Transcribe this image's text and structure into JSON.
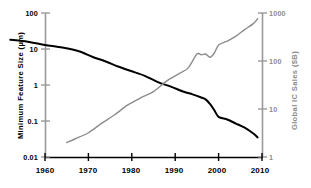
{
  "chart_data": {
    "type": "line",
    "title": "",
    "xlabel": "",
    "xlim": [
      1960,
      2010
    ],
    "xticks": [
      1960,
      1970,
      1980,
      1990,
      2000,
      2010
    ],
    "xtick_labels": [
      "1960",
      "1970",
      "1980",
      "1990",
      "2000",
      "2010"
    ],
    "grid": false,
    "legend": "none",
    "axes": [
      {
        "id": "left",
        "label": "Minimum Feature Size (µm)",
        "scale": "log",
        "ylim": [
          0.01,
          100
        ],
        "ticks": [
          100,
          10,
          1,
          0.1,
          0.01
        ],
        "tick_labels": [
          "100",
          "10",
          "1",
          "0.1",
          "0.01"
        ],
        "color": "#000000"
      },
      {
        "id": "right",
        "label": "Global IC Sales ($B)",
        "scale": "log",
        "ylim": [
          1,
          1000
        ],
        "ticks": [
          1000,
          100,
          10,
          1
        ],
        "tick_labels": [
          "1000",
          "100",
          "10",
          "1"
        ],
        "color": "#8c8c8c"
      }
    ],
    "series": [
      {
        "name": "Minimum Feature Size (µm)",
        "axis": "left",
        "color": "#000000",
        "x": [
          1952,
          1956,
          1960,
          1964,
          1968,
          1971,
          1974,
          1977,
          1980,
          1983,
          1986,
          1989,
          1992,
          1994,
          1996,
          1997,
          1998,
          1999,
          2000,
          2002,
          2004,
          2006,
          2008,
          2009
        ],
        "y": [
          18,
          16,
          13,
          11,
          8.5,
          6,
          4.5,
          3.2,
          2.4,
          1.8,
          1.2,
          0.9,
          0.65,
          0.55,
          0.45,
          0.4,
          0.3,
          0.2,
          0.13,
          0.11,
          0.085,
          0.065,
          0.045,
          0.035
        ]
      },
      {
        "name": "Global IC Sales ($B)",
        "axis": "right",
        "color": "#8c8c8c",
        "x": [
          1965,
          1967,
          1970,
          1973,
          1976,
          1979,
          1982,
          1985,
          1988,
          1991,
          1993,
          1995,
          1996,
          1997,
          1998,
          1999,
          2000,
          2002,
          2004,
          2006,
          2008,
          2009
        ],
        "y": [
          2,
          2.4,
          3.2,
          5,
          7.5,
          12,
          17,
          23,
          38,
          55,
          72,
          140,
          135,
          140,
          120,
          145,
          215,
          260,
          330,
          450,
          600,
          760
        ]
      }
    ]
  },
  "axis_titles": {
    "left": "Minimum Feature Size (µm)",
    "right": "Global IC Sales ($B)"
  },
  "colors": {
    "feature_size_line": "#000000",
    "ic_sales_line": "#8c8c8c",
    "axis_left": "#9a9a9a",
    "axis_right": "#9a9a9a",
    "axis_bottom": "#000000",
    "background": "#ffffff"
  }
}
